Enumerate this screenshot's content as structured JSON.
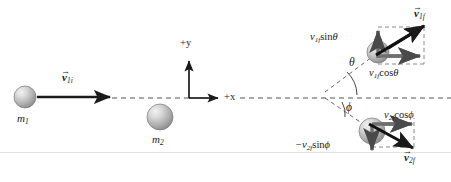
{
  "figure": {
    "background_color": "#ffffff",
    "line_color": "#1a1a1a",
    "sphere_color": "#b8b8b8",
    "width": 451,
    "height": 182
  },
  "axes": {
    "x_label": "+x",
    "y_label": "+y",
    "origin": {
      "x": 189,
      "y": 98
    }
  },
  "bodies": {
    "m1_initial": {
      "label_m": "m",
      "label_sub": "1",
      "cx": 25,
      "cy": 97,
      "r": 11
    },
    "m2_initial": {
      "label_m": "m",
      "label_sub": "2",
      "cx": 160,
      "cy": 117,
      "r": 13
    },
    "m1_final": {
      "cx": 378,
      "cy": 52,
      "r": 11
    },
    "m2_final": {
      "cx": 372,
      "cy": 131,
      "r": 13
    }
  },
  "vectors": {
    "v1i": {
      "v": "v",
      "sub": "1i",
      "arrow": "→"
    },
    "v1f": {
      "v": "v",
      "sub": "1f",
      "arrow": "→"
    },
    "v2f": {
      "v": "v",
      "sub": "2f",
      "arrow": "→"
    }
  },
  "components": {
    "v1f_sin_theta": {
      "pre": "v",
      "sub": "1f",
      "fn": "sin",
      "angle": "θ"
    },
    "v1f_cos_theta": {
      "pre": "v",
      "sub": "1f",
      "fn": "cos",
      "angle": "θ"
    },
    "v2f_cos_phi": {
      "pre": "v",
      "sub": "2f",
      "fn": "cos",
      "angle": "ϕ"
    },
    "neg_v2f_sin_phi": {
      "pre": "−v",
      "sub": "2f",
      "fn": "sin",
      "angle": "ϕ"
    }
  },
  "angles": {
    "theta": {
      "symbol": "θ",
      "x": 349,
      "y": 64,
      "description": "scattering angle of m1 above +x axis"
    },
    "phi": {
      "symbol": "ϕ",
      "x": 345,
      "y": 108,
      "description": "scattering angle of m2 below +x axis"
    }
  }
}
